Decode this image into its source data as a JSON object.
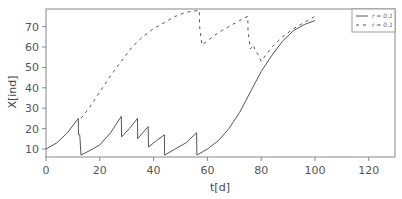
{
  "chart_data": {
    "type": "line",
    "title": "",
    "xlabel": "t[d]",
    "ylabel": "X[ind]",
    "xlim": [
      0,
      130
    ],
    "ylim": [
      6,
      79
    ],
    "grid": false,
    "legend_position": "upper right",
    "x_ticks": [
      0,
      20,
      40,
      60,
      80,
      100,
      120
    ],
    "y_ticks": [
      10,
      20,
      30,
      40,
      50,
      60,
      70
    ],
    "series": [
      {
        "name": "r = 0.1",
        "style": "solid",
        "color": "#555555",
        "points": [
          [
            0,
            10
          ],
          [
            4,
            13
          ],
          [
            8,
            18
          ],
          [
            12,
            25
          ],
          [
            12.1,
            17
          ],
          [
            12.5,
            17
          ],
          [
            12.6,
            16
          ],
          [
            13,
            7
          ],
          [
            16,
            9
          ],
          [
            20,
            12
          ],
          [
            24,
            18
          ],
          [
            28,
            26
          ],
          [
            28.1,
            16
          ],
          [
            31,
            20
          ],
          [
            34,
            25
          ],
          [
            34.1,
            15
          ],
          [
            36,
            18
          ],
          [
            38,
            21
          ],
          [
            38.1,
            11
          ],
          [
            41,
            14
          ],
          [
            44,
            17
          ],
          [
            44.1,
            7
          ],
          [
            48,
            10
          ],
          [
            52,
            13
          ],
          [
            56,
            18
          ],
          [
            56.1,
            7
          ],
          [
            60,
            10
          ],
          [
            64,
            14
          ],
          [
            68,
            20
          ],
          [
            72,
            28
          ],
          [
            76,
            38
          ],
          [
            80,
            48
          ],
          [
            84,
            56
          ],
          [
            88,
            63
          ],
          [
            92,
            68
          ],
          [
            96,
            71
          ],
          [
            100,
            73
          ]
        ]
      },
      {
        "name": "r = 0.1",
        "style": "dashed",
        "color": "#555555",
        "points": [
          [
            13,
            25
          ],
          [
            16,
            30
          ],
          [
            20,
            38
          ],
          [
            24,
            46
          ],
          [
            28,
            53
          ],
          [
            32,
            60
          ],
          [
            36,
            65
          ],
          [
            40,
            69
          ],
          [
            44,
            72
          ],
          [
            48,
            75
          ],
          [
            52,
            77
          ],
          [
            57,
            78
          ],
          [
            57.1,
            70
          ],
          [
            58,
            61
          ],
          [
            60,
            63
          ],
          [
            64,
            67
          ],
          [
            68,
            70
          ],
          [
            72,
            73
          ],
          [
            75,
            75
          ],
          [
            75.1,
            68
          ],
          [
            76,
            59
          ],
          [
            77,
            61
          ],
          [
            78,
            58
          ],
          [
            79,
            56
          ],
          [
            80,
            53
          ],
          [
            84,
            60
          ],
          [
            88,
            65
          ],
          [
            92,
            69
          ],
          [
            96,
            72
          ],
          [
            100,
            75
          ]
        ]
      }
    ]
  },
  "axes": {
    "xlabel": "t[d]",
    "ylabel": "X[ind]",
    "x_tick_labels": [
      "0",
      "20",
      "40",
      "60",
      "80",
      "100",
      "120"
    ],
    "y_tick_labels": [
      "10",
      "20",
      "30",
      "40",
      "50",
      "60",
      "70"
    ]
  },
  "legend": {
    "items": [
      {
        "label": "r = 0.1",
        "style": "solid"
      },
      {
        "label": "r = 0.1",
        "style": "dashed"
      }
    ]
  }
}
